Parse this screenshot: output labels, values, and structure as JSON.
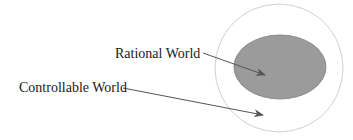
{
  "diagram": {
    "labels": {
      "rational": "Rational World",
      "controllable": "Controllable World"
    },
    "colors": {
      "outer_circle_stroke": "#cfcfcf",
      "inner_fill": "#9b9b9b",
      "inner_stroke": "#7a7a7a",
      "arrow": "#555555",
      "text": "#1a1a1a"
    }
  }
}
